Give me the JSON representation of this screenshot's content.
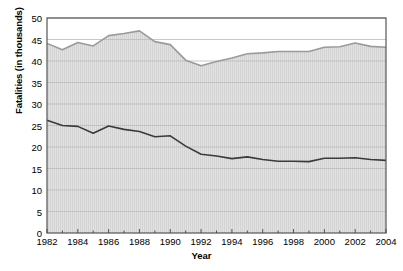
{
  "chart_data": {
    "type": "area",
    "stacked": true,
    "title": "",
    "xlabel": "Year",
    "ylabel": "Fatalities (in thousands)",
    "xlim": [
      1982,
      2004
    ],
    "ylim": [
      0,
      50
    ],
    "ytick_step": 5,
    "yticks": [
      0,
      5,
      10,
      15,
      20,
      25,
      30,
      35,
      40,
      45,
      50
    ],
    "xticks_labeled": [
      1982,
      1984,
      1986,
      1988,
      1990,
      1992,
      1994,
      1996,
      1998,
      2000,
      2002,
      2004
    ],
    "xticks_minor_every": 1,
    "grid": true,
    "legend_position": "inline-annotations",
    "x": [
      1982,
      1983,
      1984,
      1985,
      1986,
      1987,
      1988,
      1989,
      1990,
      1991,
      1992,
      1993,
      1994,
      1995,
      1996,
      1997,
      1998,
      1999,
      2000,
      2001,
      2002,
      2003,
      2004
    ],
    "series": [
      {
        "name": "Alcohol-related fatalities",
        "color": "#4a4a4a",
        "fill": "#e3e3e3",
        "values": [
          26.2,
          25.0,
          24.8,
          23.2,
          24.9,
          24.1,
          23.6,
          22.4,
          22.6,
          20.2,
          18.3,
          17.9,
          17.3,
          17.7,
          17.1,
          16.7,
          16.7,
          16.6,
          17.4,
          17.4,
          17.5,
          17.1,
          16.9
        ]
      },
      {
        "name": "Non-alcohol-related fatalities",
        "color": "#9a9a9a",
        "fill": "#e0e0e0",
        "values": [
          17.9,
          17.6,
          19.5,
          20.3,
          21.0,
          22.3,
          23.4,
          22.1,
          21.2,
          20.0,
          20.6,
          22.0,
          23.4,
          24.0,
          24.8,
          25.5,
          25.5,
          25.6,
          25.8,
          25.9,
          26.7,
          26.3,
          26.3
        ]
      }
    ],
    "totals": [
      44.1,
      42.6,
      44.3,
      43.5,
      45.9,
      46.4,
      47.0,
      44.5,
      43.8,
      40.2,
      38.9,
      39.9,
      40.7,
      41.7,
      41.9,
      42.2,
      42.2,
      42.2,
      43.2,
      43.3,
      44.2,
      43.4,
      43.2
    ],
    "annotations": [
      {
        "text": "Non-alcohol-related fatalities",
        "x_px": 215,
        "y_px": 88
      },
      {
        "text": "Alcohol-related fatalities",
        "x_px": 215,
        "y_px": 178
      }
    ]
  },
  "colors": {
    "plot_border": "#555555",
    "gridline": "#bbbbbb",
    "hatch": "#cfcfcf",
    "background": "#ffffff",
    "upper_line": "#9a9a9a",
    "lower_line": "#3a3a3a",
    "area_fill": "#e2e2e2"
  }
}
